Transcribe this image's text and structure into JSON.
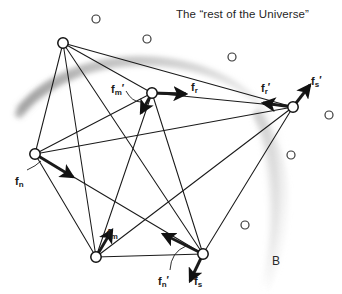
{
  "title": "The “rest of the Universe”",
  "boundary_label": "B",
  "colors": {
    "line": "#1a1a1a",
    "node_fill": "#ffffff",
    "node_stroke": "#111111",
    "star_stroke": "#3a3a3a",
    "smudge": "#9a9a9a",
    "text": "#1a1a1a"
  },
  "nodes": [
    {
      "name": "node-top",
      "cx": 63,
      "cy": 43,
      "r": 5.2
    },
    {
      "name": "node-center",
      "cx": 152,
      "cy": 93,
      "r": 5.2
    },
    {
      "name": "node-right",
      "cx": 293,
      "cy": 107,
      "r": 5.2
    },
    {
      "name": "node-left",
      "cx": 35,
      "cy": 154,
      "r": 5.2
    },
    {
      "name": "node-bottom-left",
      "cx": 96,
      "cy": 257,
      "r": 5.2
    },
    {
      "name": "node-bottom-right",
      "cx": 203,
      "cy": 254,
      "r": 5.2
    }
  ],
  "edges": [
    {
      "from": "node-top",
      "to": "node-center"
    },
    {
      "from": "node-top",
      "to": "node-right"
    },
    {
      "from": "node-top",
      "to": "node-left"
    },
    {
      "from": "node-top",
      "to": "node-bottom-left"
    },
    {
      "from": "node-top",
      "to": "node-bottom-right"
    },
    {
      "from": "node-center",
      "to": "node-right"
    },
    {
      "from": "node-center",
      "to": "node-left"
    },
    {
      "from": "node-center",
      "to": "node-bottom-left"
    },
    {
      "from": "node-center",
      "to": "node-bottom-right"
    },
    {
      "from": "node-right",
      "to": "node-left"
    },
    {
      "from": "node-right",
      "to": "node-bottom-left"
    },
    {
      "from": "node-right",
      "to": "node-bottom-right"
    },
    {
      "from": "node-left",
      "to": "node-bottom-left"
    },
    {
      "from": "node-left",
      "to": "node-bottom-right"
    },
    {
      "from": "node-bottom-left",
      "to": "node-bottom-right"
    }
  ],
  "force_arrows": [
    {
      "name": "arrow-fr",
      "x1": 152,
      "y1": 93,
      "x2": 186,
      "y2": 94
    },
    {
      "name": "arrow-fm-prime",
      "x1": 152,
      "y1": 93,
      "x2": 141,
      "y2": 113
    },
    {
      "name": "arrow-fm",
      "x1": 96,
      "y1": 257,
      "x2": 112,
      "y2": 230
    },
    {
      "name": "arrow-fn",
      "x1": 35,
      "y1": 154,
      "x2": 73,
      "y2": 177
    },
    {
      "name": "arrow-fn-prime",
      "x1": 203,
      "y1": 254,
      "x2": 163,
      "y2": 234
    },
    {
      "name": "arrow-fs",
      "x1": 203,
      "y1": 254,
      "x2": 190,
      "y2": 281
    },
    {
      "name": "arrow-fr-prime",
      "x1": 293,
      "y1": 107,
      "x2": 263,
      "y2": 103
    },
    {
      "name": "arrow-fs-prime",
      "x1": 293,
      "y1": 107,
      "x2": 310,
      "y2": 85
    }
  ],
  "force_labels": [
    {
      "name": "label-fr",
      "base": "f",
      "sub": "r",
      "prime": "",
      "x": 191,
      "y": 82
    },
    {
      "name": "label-fm-prime",
      "base": "f",
      "sub": "m",
      "prime": "′",
      "x": 111,
      "y": 84
    },
    {
      "name": "label-fm",
      "base": "f",
      "sub": "m",
      "prime": "",
      "x": 107,
      "y": 228
    },
    {
      "name": "label-fn",
      "base": "f",
      "sub": "n",
      "prime": "",
      "x": 15,
      "y": 176
    },
    {
      "name": "label-fn-prime",
      "base": "f",
      "sub": "n",
      "prime": "′",
      "x": 158,
      "y": 276
    },
    {
      "name": "label-fs",
      "base": "f",
      "sub": "s",
      "prime": "",
      "x": 194,
      "y": 276
    },
    {
      "name": "label-fr-prime",
      "base": "f",
      "sub": "r",
      "prime": "′",
      "x": 261,
      "y": 83
    },
    {
      "name": "label-fs-prime",
      "base": "f",
      "sub": "s",
      "prime": "′",
      "x": 311,
      "y": 76
    }
  ],
  "leader_lines": [
    {
      "name": "leader-fm-prime",
      "d": "M 126 91 Q 132 102 141 102"
    },
    {
      "name": "leader-fn",
      "d": "M 27 170 Q 36 166 41 161"
    },
    {
      "name": "leader-fn-prime",
      "d": "M 170 270 Q 171 252 186 246"
    }
  ],
  "stars": [
    {
      "name": "star-1",
      "cx": 96,
      "cy": 19,
      "r": 4.0
    },
    {
      "name": "star-2",
      "cx": 147,
      "cy": 39,
      "r": 4.0
    },
    {
      "name": "star-3",
      "cx": 232,
      "cy": 57,
      "r": 4.0
    },
    {
      "name": "star-4",
      "cx": 329,
      "cy": 115,
      "r": 4.0
    },
    {
      "name": "star-5",
      "cx": 291,
      "cy": 155,
      "r": 4.0
    },
    {
      "name": "star-6",
      "cx": 245,
      "cy": 225,
      "r": 4.0
    }
  ],
  "title_pos": {
    "x": 176,
    "y": 9
  },
  "boundary_label_pos": {
    "x": 272,
    "y": 255
  }
}
